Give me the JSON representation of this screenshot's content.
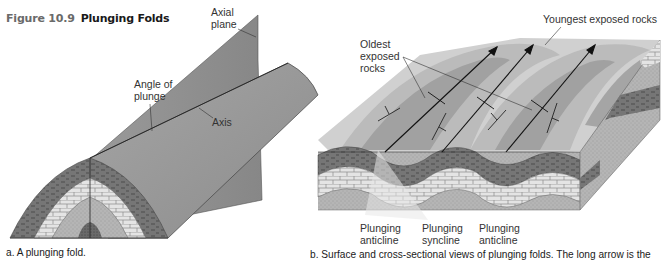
{
  "figure": {
    "number": "Figure 10.9",
    "title": "Plunging Folds"
  },
  "panel_a": {
    "labels": {
      "axial_plane_line1": "Axial",
      "axial_plane_line2": "plane",
      "angle_of_plunge_line1": "Angle of",
      "angle_of_plunge_line2": "plunge",
      "axis": "Axis"
    },
    "caption": "a. A plunging fold."
  },
  "panel_b": {
    "labels": {
      "youngest": "Youngest exposed rocks",
      "oldest_line1": "Oldest",
      "oldest_line2": "exposed",
      "oldest_line3": "rocks",
      "fold1_line1": "Plunging",
      "fold1_line2": "anticline",
      "fold2_line1": "Plunging",
      "fold2_line2": "syncline",
      "fold3_line1": "Plunging",
      "fold3_line2": "anticline"
    },
    "caption": "b. Surface and cross-sectional views of plunging folds. The long arrow is the"
  },
  "colors": {
    "plane_gray": "#8e8e8e",
    "fold_surface": "#9a9a9a",
    "shale_dark": "#7a7a7a",
    "limestone_light": "#e2e2e2",
    "sandstone_mid": "#b8b8b8",
    "line": "#1a1a1a"
  }
}
